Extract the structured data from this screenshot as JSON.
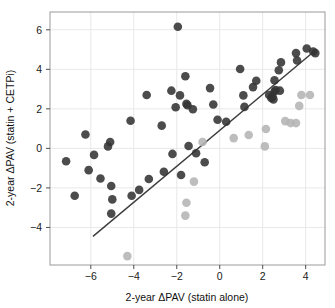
{
  "chart_data": {
    "type": "scatter",
    "title": "",
    "subtitle": "",
    "xlabel": "2-year ΔPAV (statin alone)",
    "ylabel": "2-year ΔPAV (statin + CETPi)",
    "xlim": [
      -7.9,
      4.9
    ],
    "ylim": [
      -5.9,
      6.9
    ],
    "xticks": [
      -6,
      -4,
      -2,
      0,
      2,
      4
    ],
    "yticks": [
      -4,
      -2,
      0,
      2,
      4,
      6
    ],
    "xtick_labels": [
      "−6",
      "−4",
      "−2",
      "0",
      "2",
      "4"
    ],
    "ytick_labels": [
      "−4",
      "−2",
      "0",
      "2",
      "4",
      "6"
    ],
    "grid": true,
    "grid_color": "#e8e8e8",
    "panel_border_color": "#9a9a9a",
    "panel_background": "#ffffff",
    "legend": null,
    "legend_position": "none",
    "reference_line": {
      "name": "identity-line",
      "description": "diagonal reference line y = x",
      "color": "#3c3c3c",
      "width": 1.4,
      "x_start": -5.9,
      "y_start": -4.45,
      "x_end": 4.5,
      "y_end": 5.0
    },
    "marker": {
      "shape": "circle",
      "radius": 4.3,
      "dark_color": "#2e2e2e",
      "mid_color": "#4f4f4f",
      "light_color": "#b4b4b4",
      "opacity": 0.88
    },
    "series": [
      {
        "name": "statin + CETPi responders (dark)",
        "color": "#333333",
        "points": [
          [
            -7.15,
            -0.65
          ],
          [
            -6.75,
            -2.4
          ],
          [
            -6.25,
            0.7
          ],
          [
            -6.1,
            -1.1
          ],
          [
            -5.85,
            -0.33
          ],
          [
            -5.55,
            -1.52
          ],
          [
            -5.2,
            0.1
          ],
          [
            -5.1,
            0.32
          ],
          [
            -5.05,
            -1.9
          ],
          [
            -5.0,
            -2.58
          ],
          [
            -5.05,
            -3.3
          ],
          [
            -4.15,
            1.4
          ],
          [
            -4.1,
            -2.4
          ],
          [
            -3.75,
            -2.1
          ],
          [
            -3.4,
            2.7
          ],
          [
            -3.3,
            -1.55
          ],
          [
            -2.7,
            1.15
          ],
          [
            -2.6,
            -1.18
          ],
          [
            -2.25,
            2.92
          ],
          [
            -2.2,
            -0.28
          ],
          [
            -2.05,
            2.08
          ],
          [
            -1.95,
            6.15
          ],
          [
            -1.85,
            2.68
          ],
          [
            -1.8,
            -1.35
          ],
          [
            -1.6,
            3.65
          ],
          [
            -1.55,
            2.25
          ],
          [
            -1.5,
            2.18
          ],
          [
            -1.45,
            0.12
          ],
          [
            -1.25,
            1.98
          ],
          [
            -1.1,
            -0.25
          ],
          [
            -0.7,
            -0.7
          ],
          [
            -0.45,
            3.05
          ],
          [
            -0.3,
            2.22
          ],
          [
            -0.1,
            1.45
          ],
          [
            0.3,
            1.35
          ],
          [
            0.95,
            4.02
          ],
          [
            1.1,
            2.68
          ],
          [
            1.15,
            2.1
          ],
          [
            1.55,
            3.1
          ],
          [
            1.7,
            3.42
          ],
          [
            2.3,
            2.7
          ],
          [
            2.4,
            2.55
          ],
          [
            2.45,
            2.62
          ],
          [
            2.5,
            2.48
          ],
          [
            2.55,
            3.45
          ],
          [
            2.55,
            2.88
          ],
          [
            2.6,
            2.95
          ],
          [
            2.75,
            3.95
          ],
          [
            2.8,
            2.92
          ],
          [
            2.85,
            4.35
          ],
          [
            3.55,
            4.82
          ],
          [
            3.6,
            4.45
          ],
          [
            4.05,
            5.05
          ],
          [
            4.35,
            4.9
          ],
          [
            4.45,
            4.82
          ]
        ]
      },
      {
        "name": "non-responders (light gray)",
        "color": "#b4b4b4",
        "points": [
          [
            -4.3,
            -5.45
          ],
          [
            -1.6,
            -3.4
          ],
          [
            -1.55,
            -2.75
          ],
          [
            -1.2,
            -1.68
          ],
          [
            -0.8,
            0.32
          ],
          [
            0.65,
            0.52
          ],
          [
            1.35,
            0.68
          ],
          [
            2.1,
            0.1
          ],
          [
            2.15,
            0.98
          ],
          [
            3.05,
            1.38
          ],
          [
            3.3,
            1.28
          ],
          [
            3.55,
            1.28
          ],
          [
            3.7,
            2.15
          ],
          [
            3.8,
            2.7
          ],
          [
            4.2,
            2.7
          ]
        ]
      }
    ]
  },
  "axes": {
    "x_axis_name": "x-axis",
    "y_axis_name": "y-axis"
  }
}
